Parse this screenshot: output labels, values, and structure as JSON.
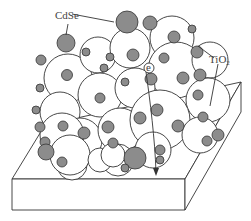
{
  "diagram": {
    "type": "schematic",
    "labels": {
      "cdse": "CdSe",
      "tio2_main": "TiO",
      "tio2_sub": "2"
    },
    "electron_symbol": "e",
    "colors": {
      "cdse_fill": "#8c8c8c",
      "tio2_fill": "#ffffff",
      "stroke": "#333333"
    },
    "components": [
      "CdSe quantum dots",
      "TiO2 nanoparticles",
      "substrate",
      "electron transport arrow"
    ]
  }
}
